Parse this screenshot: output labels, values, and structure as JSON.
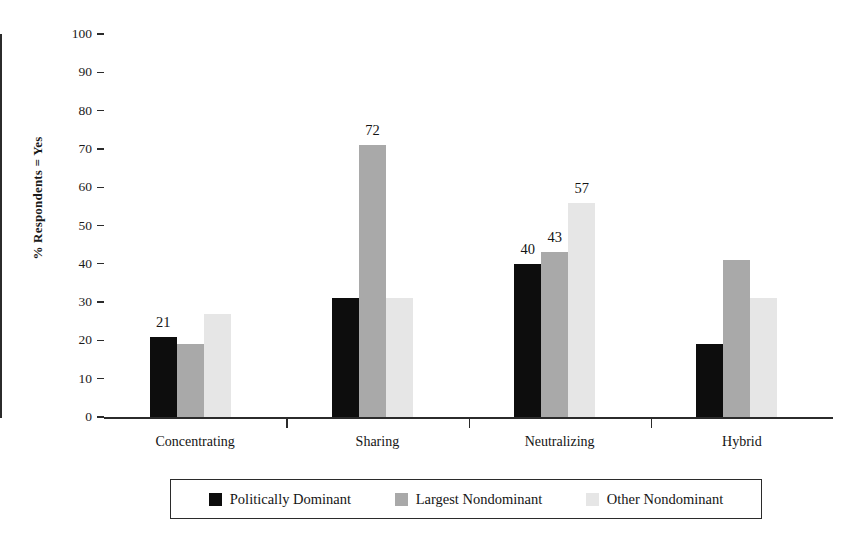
{
  "chart_data": {
    "type": "bar",
    "title": "",
    "xlabel": "",
    "ylabel": "% Respondents = Yes",
    "ylim": [
      0,
      100
    ],
    "ytick_step": 10,
    "yticks": [
      0,
      10,
      20,
      30,
      40,
      50,
      60,
      70,
      80,
      90,
      100
    ],
    "grid": false,
    "legend_position": "bottom",
    "categories": [
      "Concentrating",
      "Sharing",
      "Neutralizing",
      "Hybrid"
    ],
    "series": [
      {
        "name": "Politically Dominant",
        "color": "#0d0d0d",
        "values": [
          21,
          31,
          40,
          19
        ],
        "labels": [
          "21",
          "",
          "40",
          ""
        ]
      },
      {
        "name": "Largest Nondominant",
        "color": "#a9a9a9",
        "values": [
          19,
          71,
          43,
          41
        ],
        "labels": [
          "",
          "72",
          "43",
          ""
        ]
      },
      {
        "name": "Other Nondominant",
        "color": "#e6e6e6",
        "values": [
          27,
          31,
          56,
          31
        ],
        "labels": [
          "",
          "",
          "57",
          ""
        ]
      }
    ]
  },
  "axis": {
    "y_title": "% Respondents = Yes",
    "tick_labels": [
      "100",
      "90",
      "80",
      "70",
      "60",
      "50",
      "40",
      "30",
      "20",
      "10",
      "0"
    ]
  },
  "legend": {
    "items": [
      {
        "label": "Politically Dominant",
        "swatch": "#0d0d0d"
      },
      {
        "label": "Largest Nondominant",
        "swatch": "#a9a9a9"
      },
      {
        "label": "Other Nondominant",
        "swatch": "#e6e6e6"
      }
    ]
  }
}
